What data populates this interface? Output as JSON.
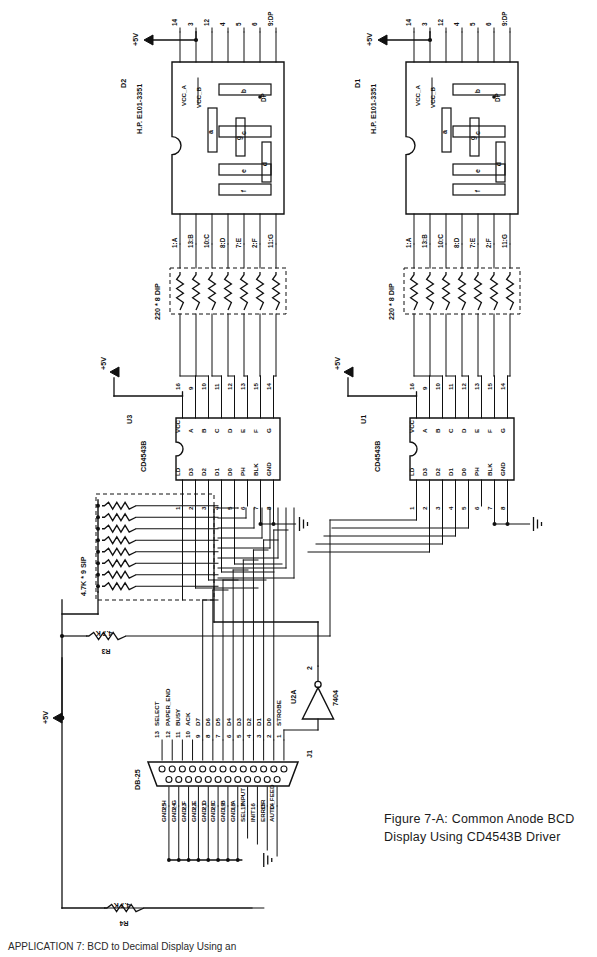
{
  "figure": {
    "caption_line1": "Figure 7-A: Common Anode BCD",
    "caption_line2": "Display Using CD4543B Driver",
    "bottom_note": "APPLICATION 7: BCD to Decimal Display Using an"
  },
  "power": {
    "rail_label": "+5V",
    "rails": [
      "+5V",
      "+5V",
      "+5V",
      "+5V",
      "+5V"
    ]
  },
  "displays": [
    {
      "ref": "D2",
      "part": "H.P. E101-3351",
      "vcc_a_label": "VCC_A",
      "vcc_b_label": "VCC_B",
      "dp_label": "DP",
      "top_pins": [
        "14",
        "3",
        "12",
        "4",
        "5",
        "6",
        "9:DP"
      ],
      "bottom_pins": [
        "1:A",
        "13:B",
        "10:C",
        "8:D",
        "7:E",
        "2:F",
        "11:G"
      ],
      "segments": [
        "a",
        "b",
        "c",
        "d",
        "e",
        "f",
        "g"
      ]
    },
    {
      "ref": "D1",
      "part": "H.P. E101-3351",
      "vcc_a_label": "VCC_A",
      "vcc_b_label": "VCC_B",
      "dp_label": "DP",
      "top_pins": [
        "14",
        "3",
        "12",
        "4",
        "5",
        "6",
        "9:DP"
      ],
      "bottom_pins": [
        "1:A",
        "13:B",
        "10:C",
        "8:D",
        "7:E",
        "2:F",
        "11:G"
      ],
      "segments": [
        "a",
        "b",
        "c",
        "d",
        "e",
        "f",
        "g"
      ]
    }
  ],
  "resistor_packs": [
    {
      "label": "220 * 8 DIP",
      "count": 7
    },
    {
      "label": "220 * 8 DIP",
      "count": 7
    }
  ],
  "sip_pack": {
    "label": "4.7K * 9 SIP",
    "count": 8
  },
  "discrete_resistors": [
    {
      "ref": "R3",
      "value": "4.7 K"
    },
    {
      "ref": "R4",
      "value": "4.7 K"
    }
  ],
  "ics": [
    {
      "ref": "U3",
      "part": "CD4543B",
      "top_pin_numbers": [
        "16",
        "9",
        "10",
        "11",
        "12",
        "13",
        "15",
        "14"
      ],
      "top_pin_names": [
        "VCC",
        "A",
        "B",
        "C",
        "D",
        "E",
        "F",
        "G"
      ],
      "bottom_pin_numbers": [
        "1",
        "2",
        "3",
        "4",
        "5",
        "6",
        "7",
        "8"
      ],
      "bottom_pin_names": [
        "LD",
        "D3",
        "D2",
        "D1",
        "D0",
        "PH",
        "BLK",
        "GND"
      ]
    },
    {
      "ref": "U1",
      "part": "CD4543B",
      "top_pin_numbers": [
        "16",
        "9",
        "10",
        "11",
        "12",
        "13",
        "15",
        "14"
      ],
      "top_pin_names": [
        "VCC",
        "A",
        "B",
        "C",
        "D",
        "E",
        "F",
        "G"
      ],
      "bottom_pin_numbers": [
        "1",
        "2",
        "3",
        "4",
        "5",
        "6",
        "7",
        "8"
      ],
      "bottom_pin_names": [
        "LD",
        "D3",
        "D2",
        "D1",
        "D0",
        "PH",
        "BLK",
        "GND"
      ]
    }
  ],
  "inverter": {
    "ref": "U2A",
    "part": "7404",
    "pin_in": "1",
    "pin_out": "2"
  },
  "connector": {
    "ref": "J1",
    "type": "DB-25",
    "top_row": [
      {
        "pin": "13",
        "name": "SELECT"
      },
      {
        "pin": "12",
        "name": "PAPER_END"
      },
      {
        "pin": "11",
        "name": "BUSY"
      },
      {
        "pin": "10",
        "name": "ACK"
      },
      {
        "pin": "9",
        "name": "D7"
      },
      {
        "pin": "8",
        "name": "D6"
      },
      {
        "pin": "7",
        "name": "D5"
      },
      {
        "pin": "6",
        "name": "D4"
      },
      {
        "pin": "5",
        "name": "D3"
      },
      {
        "pin": "4",
        "name": "D2"
      },
      {
        "pin": "3",
        "name": "D1"
      },
      {
        "pin": "2",
        "name": "D0"
      },
      {
        "pin": "1",
        "name": "STROBE"
      }
    ],
    "bottom_row": [
      {
        "pin": "25",
        "name": "GND_H"
      },
      {
        "pin": "24",
        "name": "GND_G"
      },
      {
        "pin": "23",
        "name": "GND_F"
      },
      {
        "pin": "22",
        "name": "GND_E"
      },
      {
        "pin": "21",
        "name": "GND_D"
      },
      {
        "pin": "20",
        "name": "GND_C"
      },
      {
        "pin": "19",
        "name": "GND_B"
      },
      {
        "pin": "18",
        "name": "GND_A"
      },
      {
        "pin": "17",
        "name": "SEL_INPUT"
      },
      {
        "pin": "16",
        "name": "INIT"
      },
      {
        "pin": "15",
        "name": "ERROR"
      },
      {
        "pin": "14",
        "name": "AUTO_FEED"
      }
    ]
  },
  "colors": {
    "ink": "#111111",
    "paper": "#ffffff"
  }
}
